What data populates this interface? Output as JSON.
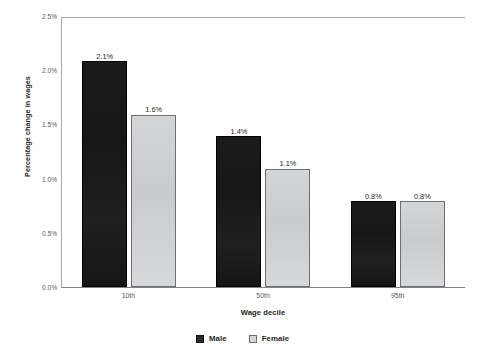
{
  "chart_data": {
    "type": "bar",
    "title": "",
    "subtitle": "",
    "xlabel": "Wage decile",
    "ylabel": "Percentage change in wages",
    "categories": [
      "10th",
      "50th",
      "95th"
    ],
    "series": [
      {
        "name": "Male",
        "color": "#161616",
        "values": [
          2.1,
          1.4,
          0.8
        ],
        "labels": [
          "2.1%",
          "1.4%",
          "0.8%"
        ]
      },
      {
        "name": "Female",
        "color": "#d0d1d2",
        "values": [
          1.6,
          1.1,
          0.8
        ],
        "labels": [
          "1.6%",
          "1.1%",
          "0.8%"
        ]
      }
    ],
    "ylim": [
      0,
      2.5
    ],
    "ytick_values": [
      0.0,
      0.5,
      1.0,
      1.5,
      2.0,
      2.5
    ],
    "ytick_labels": [
      "0.0%",
      "0.5%",
      "1.0%",
      "1.5%",
      "2.0%",
      "2.5%"
    ],
    "grid": false,
    "legend_position": "bottom-center",
    "value_labels_shown": true
  },
  "axes": {
    "y_title": "Percentage change in wages",
    "x_title": "Wage decile",
    "y_ticks": [
      "2.5%",
      "2.0%",
      "1.5%",
      "1.0%",
      "0.5%",
      "0.0%"
    ],
    "x_ticks": [
      "10th",
      "50th",
      "95th"
    ]
  },
  "legend": {
    "items": [
      {
        "label": "Male",
        "swatch": "male-swatch"
      },
      {
        "label": "Female",
        "swatch": "female-swatch"
      }
    ]
  },
  "bars": [
    {
      "group": "10th",
      "series": "Male",
      "label": "2.1%",
      "value": 2.1
    },
    {
      "group": "10th",
      "series": "Female",
      "label": "1.6%",
      "value": 1.6
    },
    {
      "group": "50th",
      "series": "Male",
      "label": "1.4%",
      "value": 1.4
    },
    {
      "group": "50th",
      "series": "Female",
      "label": "1.1%",
      "value": 1.1
    },
    {
      "group": "95th",
      "series": "Male",
      "label": "0.8%",
      "value": 0.8
    },
    {
      "group": "95th",
      "series": "Female",
      "label": "0.8%",
      "value": 0.8
    }
  ],
  "colors": {
    "male": "#161616",
    "female": "#d4d5d6",
    "axis_line": "#a7a9ac",
    "tick_text": "#58595b",
    "title_text": "#231f20",
    "background": "#ffffff"
  }
}
